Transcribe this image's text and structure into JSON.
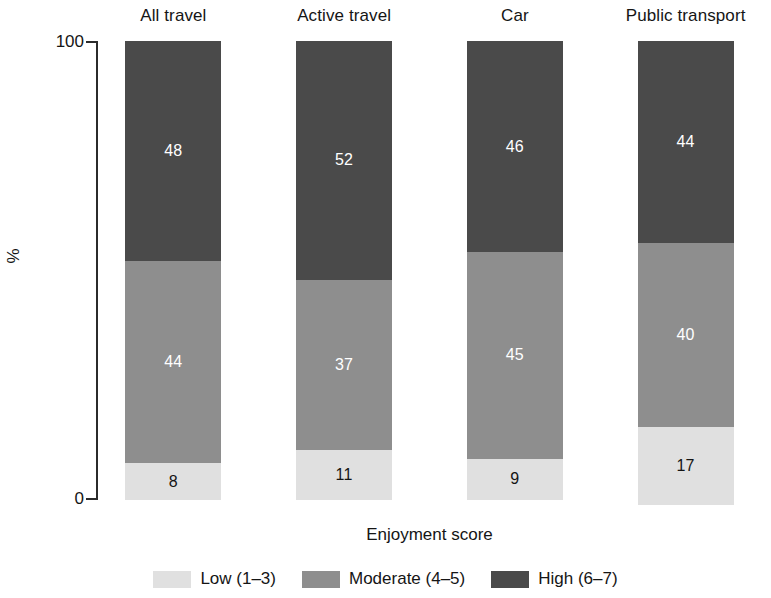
{
  "chart_data": {
    "type": "bar",
    "subtype": "stacked-100-percent",
    "title": "",
    "xlabel": "Enjoyment score",
    "ylabel": "%",
    "ylim": [
      0,
      100
    ],
    "ytick_labels": [
      "100",
      "0"
    ],
    "grid": false,
    "legend_position": "bottom",
    "orientation": "vertical",
    "categories": [
      "All travel",
      "Active travel",
      "Car",
      "Public transport"
    ],
    "series": [
      {
        "name": "Low (1–3)",
        "color": "#e0e0e0",
        "label_color": "#141414",
        "values": [
          8,
          11,
          9,
          17
        ]
      },
      {
        "name": "Moderate (4–5)",
        "color": "#8e8e8e",
        "label_color": "#ffffff",
        "values": [
          44,
          37,
          45,
          40
        ]
      },
      {
        "name": "High (6–7)",
        "color": "#4a4a4a",
        "label_color": "#ffffff",
        "values": [
          48,
          52,
          46,
          44
        ]
      }
    ]
  },
  "panels": [
    {
      "title": "All travel",
      "segments": [
        {
          "key": "high",
          "label": "48",
          "value": 48
        },
        {
          "key": "moderate",
          "label": "44",
          "value": 44
        },
        {
          "key": "low",
          "label": "8",
          "value": 8
        }
      ]
    },
    {
      "title": "Active travel",
      "segments": [
        {
          "key": "high",
          "label": "52",
          "value": 52
        },
        {
          "key": "moderate",
          "label": "37",
          "value": 37
        },
        {
          "key": "low",
          "label": "11",
          "value": 11
        }
      ]
    },
    {
      "title": "Car",
      "segments": [
        {
          "key": "high",
          "label": "46",
          "value": 46
        },
        {
          "key": "moderate",
          "label": "45",
          "value": 45
        },
        {
          "key": "low",
          "label": "9",
          "value": 9
        }
      ]
    },
    {
      "title": "Public transport",
      "segments": [
        {
          "key": "high",
          "label": "44",
          "value": 44
        },
        {
          "key": "moderate",
          "label": "40",
          "value": 40
        },
        {
          "key": "low",
          "label": "17",
          "value": 17
        }
      ]
    }
  ],
  "axes": {
    "y_title": "%",
    "y_max_label": "100",
    "y_min_label": "0",
    "x_title": "Enjoyment score"
  },
  "legend": {
    "items": [
      {
        "label": "Low (1–3)",
        "color": "#e0e0e0",
        "key": "low"
      },
      {
        "label": "Moderate (4–5)",
        "color": "#8e8e8e",
        "key": "moderate"
      },
      {
        "label": "High (6–7)",
        "color": "#4a4a4a",
        "key": "high"
      }
    ]
  },
  "colors": {
    "low": "#e0e0e0",
    "moderate": "#8e8e8e",
    "high": "#4a4a4a",
    "axis": "#2b2b2b",
    "text": "#151515",
    "background": "#ffffff"
  }
}
